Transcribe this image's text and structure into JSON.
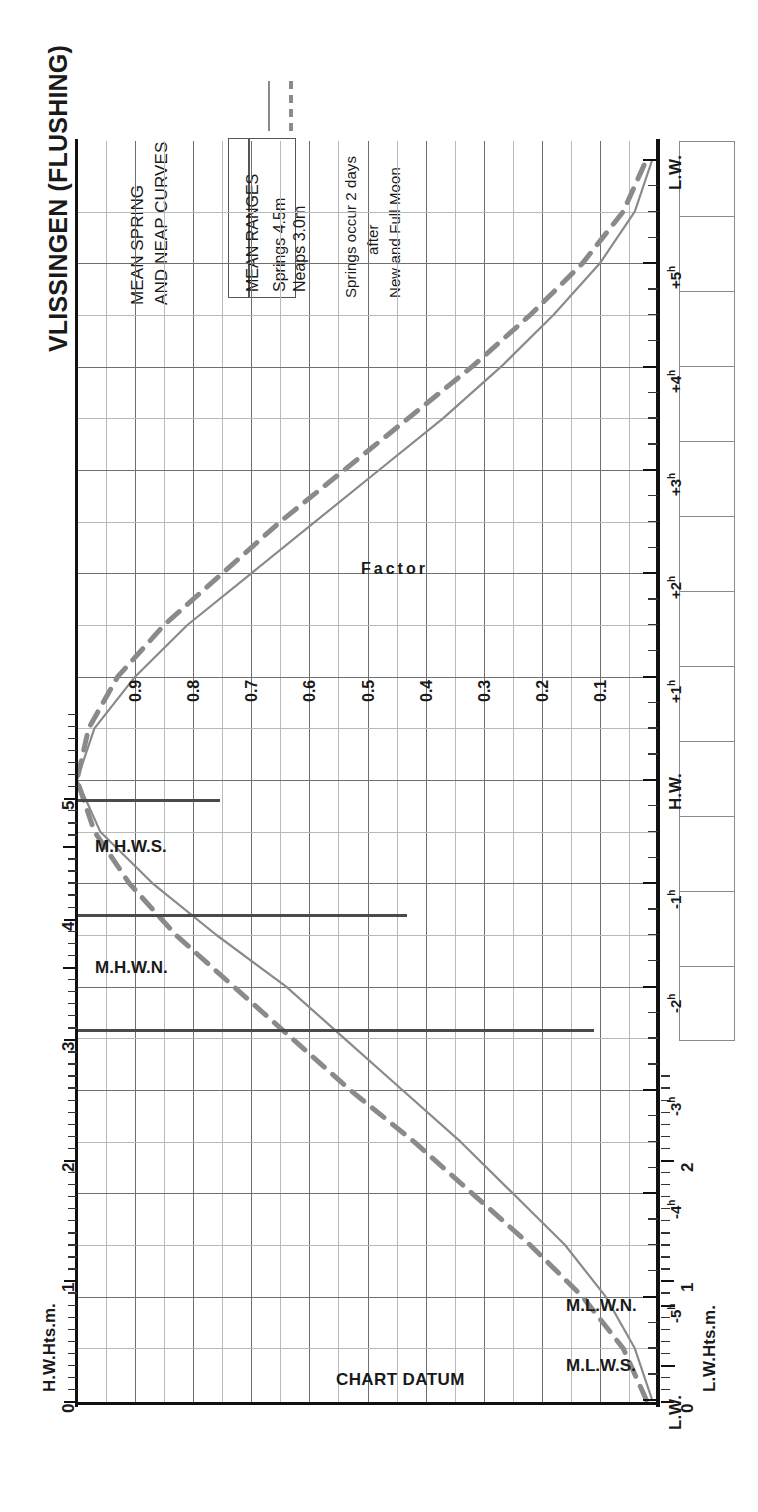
{
  "header": {
    "title": "VLISSINGEN (FLUSHING)",
    "subtitle_line1": "MEAN SPRING",
    "subtitle_line2": "AND NEAP CURVES",
    "note_line1": "Springs occur 2 days",
    "note_line2": "after",
    "note_line3": "New and Full Moon"
  },
  "legend": {
    "heading": "MEAN RANGES",
    "spring_label": "Springs 4.5m",
    "neap_label": "Neaps   3.0m",
    "spring_style": "solid",
    "neap_style": "dashed"
  },
  "axes": {
    "hw_axis_title": "H.W.Hts.m.",
    "lw_axis_title": "L.W.Hts.m.",
    "hw_ticks": [
      "0",
      "1",
      "2",
      "3",
      "4",
      "5"
    ],
    "lw_ticks": [
      "0",
      "1",
      "2"
    ],
    "datum_label": "CHART DATUM",
    "hw_markers": [
      {
        "label": "M.H.W.S.",
        "height": 4.6
      },
      {
        "label": "M.H.W.N.",
        "height": 3.6
      }
    ],
    "lw_markers": [
      {
        "label": "M.L.W.N.",
        "height": 0.8
      },
      {
        "label": "M.L.W.S.",
        "height": 0.3
      }
    ]
  },
  "factor_axis": {
    "title": "Factor",
    "labels": [
      "0.9",
      "0.8",
      "0.7",
      "0.6",
      "0.5",
      "0.4",
      "0.3",
      "0.2",
      "0.1"
    ],
    "values": [
      0.9,
      0.8,
      0.7,
      0.6,
      0.5,
      0.4,
      0.3,
      0.2,
      0.1
    ]
  },
  "time_axis": {
    "labels": [
      "L.W.",
      "-5",
      "-4",
      "-3",
      "-2",
      "-1",
      "H.W.",
      "+1",
      "+2",
      "+3",
      "+4",
      "+5",
      "L.W."
    ],
    "hour_suffix": "h",
    "high_water": "H.W.",
    "low_water": "L.W."
  },
  "colors": {
    "curve": "#8a8a8a",
    "axis": "#111111",
    "grid_major": "#6f6f6f",
    "grid_minor": "#b9b9b9",
    "connector": "#4a4a4a",
    "text": "#1a1a1a"
  },
  "chart_data": {
    "type": "line",
    "orientation": "rotated-90",
    "xlabel": "Factor",
    "ylabel": "Hours relative to High Water",
    "xlim": [
      1.0,
      0.0
    ],
    "ylim": [
      -6,
      6
    ],
    "grid": true,
    "legend_position": "top-left",
    "mean_ranges": {
      "springs_m": 4.5,
      "neaps_m": 3.0
    },
    "chart_datum_m": 0,
    "hw_height_scale_m": [
      0,
      1,
      2,
      3,
      4,
      5
    ],
    "lw_height_scale_m": [
      0,
      1,
      2
    ],
    "tide_levels": {
      "MHWS_m": 4.6,
      "MHWN_m": 3.6,
      "MLWN_m": 0.8,
      "MLWS_m": 0.3
    },
    "series": [
      {
        "name": "Springs 4.5m",
        "style": "solid",
        "hours": [
          -6.0,
          -5.5,
          -5.0,
          -4.5,
          -4.0,
          -3.5,
          -3.0,
          -2.5,
          -2.0,
          -1.5,
          -1.0,
          -0.5,
          0.0,
          0.5,
          1.0,
          1.5,
          2.0,
          2.5,
          3.0,
          3.5,
          4.0,
          4.5,
          5.0,
          5.5,
          6.0
        ],
        "factor": [
          0.01,
          0.04,
          0.09,
          0.16,
          0.25,
          0.34,
          0.44,
          0.54,
          0.64,
          0.76,
          0.87,
          0.96,
          1.0,
          0.97,
          0.9,
          0.81,
          0.7,
          0.59,
          0.48,
          0.37,
          0.27,
          0.18,
          0.1,
          0.04,
          0.01
        ]
      },
      {
        "name": "Neaps 3.0m",
        "style": "dashed",
        "hours": [
          -6.0,
          -5.5,
          -5.0,
          -4.5,
          -4.0,
          -3.5,
          -3.0,
          -2.5,
          -2.0,
          -1.5,
          -1.0,
          -0.5,
          0.0,
          0.5,
          1.0,
          1.5,
          2.0,
          2.5,
          3.0,
          3.5,
          4.0,
          4.5,
          5.0,
          5.5,
          6.0
        ],
        "factor": [
          0.02,
          0.06,
          0.13,
          0.22,
          0.32,
          0.42,
          0.53,
          0.63,
          0.73,
          0.83,
          0.91,
          0.97,
          1.0,
          0.98,
          0.93,
          0.85,
          0.75,
          0.65,
          0.54,
          0.43,
          0.32,
          0.22,
          0.13,
          0.06,
          0.02
        ]
      }
    ],
    "annotations": [
      "Springs occur 2 days after New and Full Moon",
      "CHART DATUM"
    ]
  }
}
